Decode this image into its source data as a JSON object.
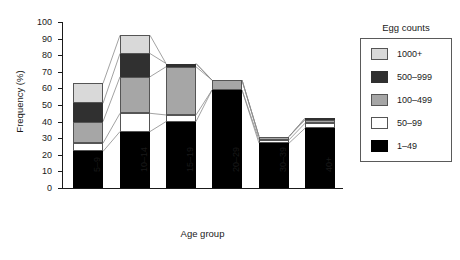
{
  "chart_data": {
    "type": "bar",
    "stacked": true,
    "title": "",
    "xlabel": "Age group",
    "ylabel": "Frequency (%)",
    "ylim": [
      0,
      100
    ],
    "yticks": [
      0,
      10,
      20,
      30,
      40,
      50,
      60,
      70,
      80,
      90,
      100
    ],
    "grid": false,
    "legend_title": "Egg counts",
    "legend_position": "right",
    "categories": [
      "5–9",
      "10–14",
      "15–19",
      "20–29",
      "30–39",
      "40+"
    ],
    "series": [
      {
        "name": "1–49",
        "color": "#000000",
        "values": [
          22,
          34,
          40,
          59,
          27,
          36
        ]
      },
      {
        "name": "50–99",
        "color": "#ffffff",
        "values": [
          5,
          11,
          4,
          0,
          2,
          3
        ]
      },
      {
        "name": "100–499",
        "color": "#a6a6a6",
        "values": [
          13,
          22,
          29,
          6,
          2,
          2
        ]
      },
      {
        "name": "500–999",
        "color": "#303030",
        "values": [
          11,
          14,
          2,
          0,
          0,
          1
        ]
      },
      {
        "name": "1000+",
        "color": "#d9d9d9",
        "values": [
          12,
          11,
          0,
          0,
          0,
          0
        ]
      }
    ],
    "totals": [
      63,
      92,
      75,
      65,
      31,
      42
    ]
  },
  "axis": {
    "y_title": "Frequency (%)",
    "x_title": "Age group",
    "y_ticks": [
      "0",
      "10",
      "20",
      "30",
      "40",
      "50",
      "60",
      "70",
      "80",
      "90",
      "100"
    ],
    "x_ticks": [
      "5–9",
      "10–14",
      "15–19",
      "20–29",
      "30–39",
      "40+"
    ]
  },
  "legend": {
    "title": "Egg counts",
    "items": [
      {
        "label": "1000+",
        "swatch": "sw-1000"
      },
      {
        "label": "500–999",
        "swatch": "sw-500"
      },
      {
        "label": "100–499",
        "swatch": "sw-100"
      },
      {
        "label": "50–99",
        "swatch": "sw-50"
      },
      {
        "label": "1–49",
        "swatch": "sw-1"
      }
    ]
  }
}
